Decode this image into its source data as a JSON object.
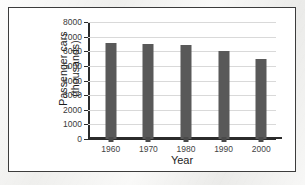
{
  "chart_data": {
    "type": "bar",
    "title": "",
    "xlabel": "Year",
    "ylabel_line1": "Passenger cars",
    "ylabel_line2": "(thousands)",
    "categories": [
      "1960",
      "1970",
      "1980",
      "1990",
      "2000"
    ],
    "values": [
      6550,
      6500,
      6400,
      6000,
      5500
    ],
    "ylim": [
      0,
      8000
    ],
    "ytick_labels": [
      "8000",
      "7000",
      "6000",
      "5000",
      "4000",
      "3000",
      "2000",
      "1000",
      "0"
    ],
    "ytick_values": [
      8000,
      7000,
      6000,
      5000,
      4000,
      3000,
      2000,
      1000,
      0
    ],
    "grid": "horizontal",
    "legend": "none",
    "bar_color": "#595959",
    "gridline_color": "#d9d9d9",
    "axis_color": "#2b2b2b"
  }
}
